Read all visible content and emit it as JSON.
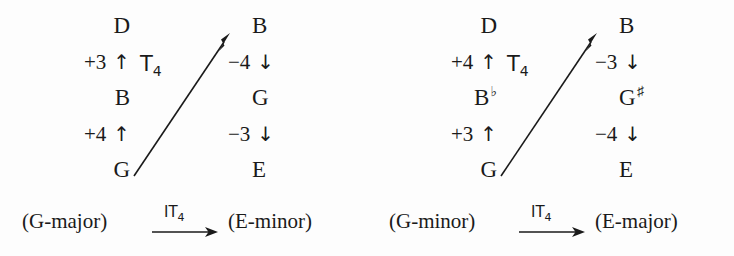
{
  "figure": {
    "type": "music-transformation-diagram",
    "ink_color": "#1a1a1a",
    "background_color": "#fdfdfd"
  },
  "panels": [
    {
      "id": "panel-left",
      "source_key_label": "(G-major)",
      "target_key_label": "(E-minor)",
      "diagonal_label_base": "T",
      "diagonal_label_sub": "4",
      "bottom_label_base": "IT",
      "bottom_label_sub": "4",
      "source_stack": [
        {
          "kind": "note",
          "text": "D"
        },
        {
          "kind": "interval",
          "text": "+3",
          "arrow": "↑"
        },
        {
          "kind": "note",
          "text": "B"
        },
        {
          "kind": "interval",
          "text": "+4",
          "arrow": "↑"
        },
        {
          "kind": "note",
          "text": "G"
        }
      ],
      "target_stack": [
        {
          "kind": "note",
          "text": "B"
        },
        {
          "kind": "interval",
          "text": "−4",
          "arrow": "↓"
        },
        {
          "kind": "note",
          "text": "G"
        },
        {
          "kind": "interval",
          "text": "−3",
          "arrow": "↓"
        },
        {
          "kind": "note",
          "text": "E"
        }
      ]
    },
    {
      "id": "panel-right",
      "source_key_label": "(G-minor)",
      "target_key_label": "(E-major)",
      "diagonal_label_base": "T",
      "diagonal_label_sub": "4",
      "bottom_label_base": "IT",
      "bottom_label_sub": "4",
      "source_stack": [
        {
          "kind": "note",
          "text": "D"
        },
        {
          "kind": "interval",
          "text": "+4",
          "arrow": "↑"
        },
        {
          "kind": "note",
          "text": "B",
          "accidental": "♭"
        },
        {
          "kind": "interval",
          "text": "+3",
          "arrow": "↑"
        },
        {
          "kind": "note",
          "text": "G"
        }
      ],
      "target_stack": [
        {
          "kind": "note",
          "text": "B"
        },
        {
          "kind": "interval",
          "text": "−3",
          "arrow": "↓"
        },
        {
          "kind": "note",
          "text": "G",
          "accidental": "♯"
        },
        {
          "kind": "interval",
          "text": "−4",
          "arrow": "↓"
        },
        {
          "kind": "note",
          "text": "E"
        }
      ]
    }
  ]
}
